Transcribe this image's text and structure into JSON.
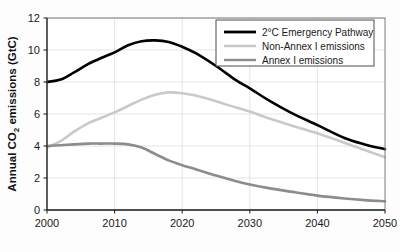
{
  "chart_data": {
    "type": "line",
    "title": "",
    "xlabel": "",
    "ylabel_prefix": "Annual CO",
    "ylabel_sub": "2",
    "ylabel_suffix": " emissions (GtC)",
    "ylabel_full": "Annual CO2 emissions (GtC)",
    "xlim": [
      2000,
      2050
    ],
    "ylim": [
      0,
      12
    ],
    "xticks": [
      2000,
      2010,
      2020,
      2030,
      2040,
      2050
    ],
    "yticks": [
      0,
      2,
      4,
      6,
      8,
      10,
      12
    ],
    "xtick_labels": [
      "2000",
      "2010",
      "2020",
      "2030",
      "2040",
      "2050"
    ],
    "ytick_labels": [
      "0",
      "2",
      "4",
      "6",
      "8",
      "10",
      "12"
    ],
    "grid": true,
    "grid_color": "#d9d9d9",
    "legend_position": "top-right",
    "x": [
      2000,
      2002,
      2004,
      2006,
      2008,
      2010,
      2012,
      2014,
      2016,
      2018,
      2020,
      2022,
      2025,
      2028,
      2030,
      2033,
      2036,
      2040,
      2044,
      2047,
      2050
    ],
    "series": [
      {
        "name": "2°C Emergency Pathway",
        "color": "#000000",
        "width": 2.6,
        "values": [
          8.0,
          8.15,
          8.6,
          9.1,
          9.5,
          9.85,
          10.3,
          10.55,
          10.6,
          10.5,
          10.2,
          9.8,
          9.0,
          8.1,
          7.6,
          6.8,
          6.1,
          5.3,
          4.5,
          4.1,
          3.8
        ]
      },
      {
        "name": "Non-Annex I emissions",
        "color": "#c9c9c9",
        "width": 2.6,
        "values": [
          3.9,
          4.3,
          4.9,
          5.4,
          5.75,
          6.1,
          6.5,
          6.9,
          7.2,
          7.35,
          7.3,
          7.15,
          6.8,
          6.4,
          6.15,
          5.7,
          5.3,
          4.8,
          4.2,
          3.75,
          3.3
        ]
      },
      {
        "name": "Annex I emissions",
        "color": "#8c8c8c",
        "width": 2.6,
        "values": [
          4.0,
          4.05,
          4.1,
          4.15,
          4.15,
          4.15,
          4.1,
          3.9,
          3.5,
          3.1,
          2.8,
          2.55,
          2.15,
          1.8,
          1.6,
          1.35,
          1.15,
          0.9,
          0.72,
          0.62,
          0.55
        ]
      }
    ]
  },
  "legend": {
    "items": [
      {
        "label": "2°C Emergency Pathway",
        "color": "#000000"
      },
      {
        "label": "Non-Annex I emissions",
        "color": "#c9c9c9"
      },
      {
        "label": "Annex I emissions",
        "color": "#8c8c8c"
      }
    ]
  }
}
